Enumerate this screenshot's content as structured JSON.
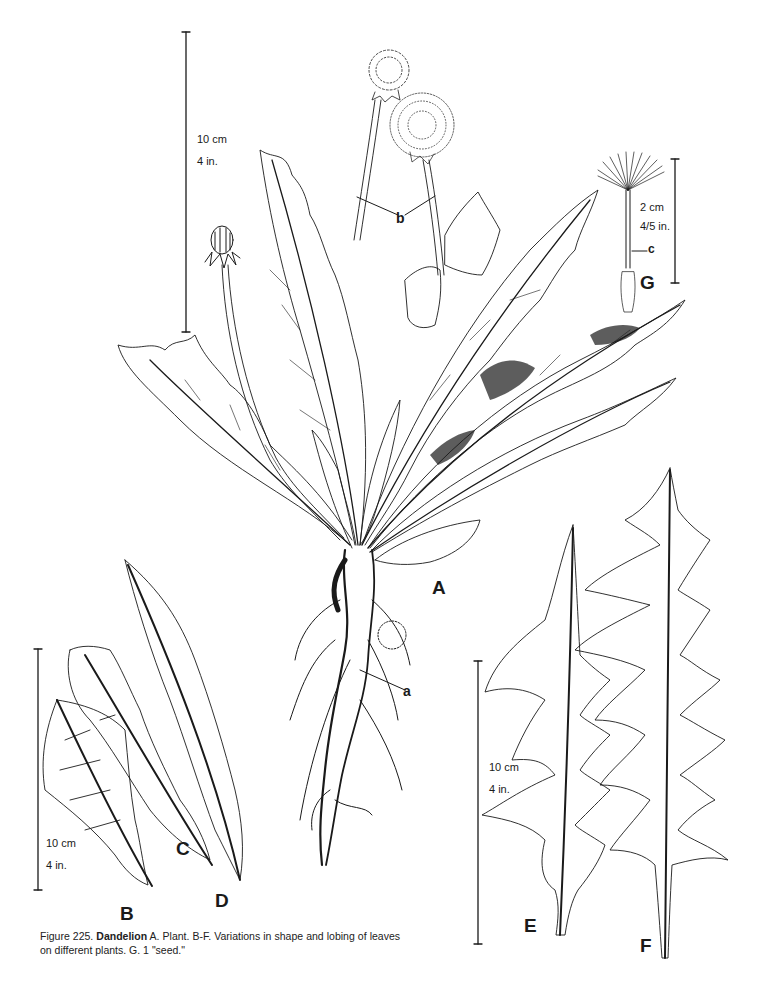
{
  "figure": {
    "caption": {
      "number": "Figure 225.",
      "name": "Dandelion",
      "text": "A. Plant.  B-F. Variations in shape and lobing of leaves on different plants.  G. 1 \"seed.\""
    },
    "panel_labels": {
      "A": "A",
      "B": "B",
      "C": "C",
      "D": "D",
      "E": "E",
      "F": "F",
      "G": "G"
    },
    "part_labels": {
      "a": "a",
      "b": "b",
      "c": "c"
    },
    "scale_bars": {
      "plant": {
        "metric": "10 cm",
        "imperial": "4 in."
      },
      "leaves_bcd": {
        "metric": "10 cm",
        "imperial": "4 in."
      },
      "leaves_ef": {
        "metric": "10 cm",
        "imperial": "4 in."
      },
      "seed": {
        "metric": "2 cm",
        "imperial": "4/5 in."
      }
    },
    "colors": {
      "ink": "#1a1a1a",
      "paper": "#ffffff"
    }
  }
}
